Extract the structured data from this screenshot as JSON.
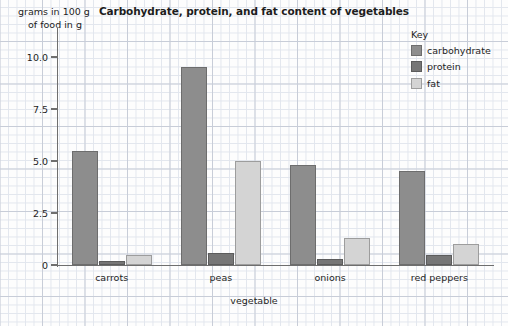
{
  "chart_data": {
    "type": "bar",
    "title": "Carbohydrate, protein, and fat content of vegetables",
    "xlabel": "vegetable",
    "ylabel": "grams in 100 g of food in g",
    "ylabel_line1": "grams in 100 g",
    "ylabel_line2": "of food in g",
    "categories": [
      "carrots",
      "peas",
      "onions",
      "red peppers"
    ],
    "series": [
      {
        "name": "carbohydrate",
        "color": "#8d8d8d",
        "values": [
          5.5,
          9.5,
          4.8,
          4.5
        ]
      },
      {
        "name": "protein",
        "color": "#767676",
        "values": [
          0.2,
          0.6,
          0.3,
          0.5
        ]
      },
      {
        "name": "fat",
        "color": "#d4d4d4",
        "values": [
          0.5,
          5.0,
          1.3,
          1.0
        ]
      }
    ],
    "ylim": [
      0,
      10.5
    ],
    "yticks": [
      0,
      2.5,
      5.0,
      7.5,
      10.0
    ],
    "ytick_labels": [
      "0",
      "2.5",
      "5.0",
      "7.5",
      "10.0"
    ],
    "grid": "graph-paper",
    "legend_position": "top-right"
  },
  "legend": {
    "title": "Key",
    "entries": [
      {
        "label": "carbohydrate",
        "swatch": "carbohydrate"
      },
      {
        "label": "protein",
        "swatch": "protein"
      },
      {
        "label": "fat",
        "swatch": "fat"
      }
    ]
  },
  "colors": {
    "carbohydrate": "#8d8d8d",
    "protein": "#767676",
    "fat": "#d4d4d4",
    "axis": "#6e6e6e",
    "grid_major": "#c8cdd8",
    "grid_minor": "#e2e6ee",
    "text": "#1d1d1d"
  }
}
